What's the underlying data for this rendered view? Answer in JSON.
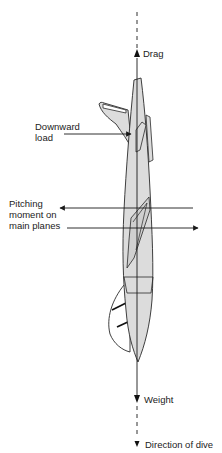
{
  "diagram": {
    "type": "force-diagram",
    "labels": {
      "drag": "Drag",
      "downward_load_line1": "Downward",
      "downward_load_line2": "load",
      "pitching_line1": "Pitching",
      "pitching_line2": "moment on",
      "pitching_line3": "main planes",
      "weight": "Weight",
      "direction_of_dive": "Direction of dive"
    },
    "forces": [
      {
        "name": "Drag",
        "direction": "up"
      },
      {
        "name": "Downward load",
        "direction": "right",
        "applied_to": "tailplane"
      },
      {
        "name": "Pitching moment on main planes",
        "direction": "couple (left/right)"
      },
      {
        "name": "Weight",
        "direction": "down"
      }
    ],
    "colors": {
      "aircraft_fill": "#dcdcdc",
      "outline": "#2a2a2a",
      "line": "#1a1a1a",
      "background": "#ffffff"
    }
  }
}
